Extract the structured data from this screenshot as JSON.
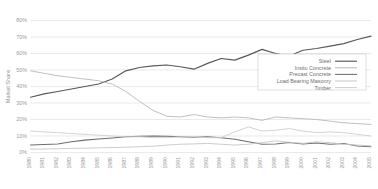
{
  "chart_data": {
    "type": "line",
    "title": "",
    "xlabel": "",
    "ylabel": "Market Share",
    "ylim": [
      0,
      80
    ],
    "ytick_labels": [
      "0%",
      "10%",
      "20%",
      "30%",
      "40%",
      "50%",
      "60%",
      "70%",
      "80%"
    ],
    "ytick_values": [
      0,
      10,
      20,
      30,
      40,
      50,
      60,
      70,
      80
    ],
    "grid": true,
    "legend_position": "center-right",
    "x": [
      1980,
      1981,
      1982,
      1983,
      1984,
      1985,
      1986,
      1987,
      1988,
      1989,
      1990,
      1991,
      1992,
      1993,
      1994,
      1995,
      1996,
      1997,
      1998,
      1999,
      2000,
      2001,
      2002,
      2003,
      2004,
      2005
    ],
    "xtick_labels": [
      "1980",
      "1981",
      "1982",
      "1983",
      "1984",
      "1985",
      "1986",
      "1987",
      "1988",
      "1989",
      "1990",
      "1991",
      "1992",
      "1993",
      "1994",
      "1995",
      "1996",
      "1997",
      "1998",
      "1999",
      "2000",
      "2001",
      "2002",
      "2003",
      "2004",
      "2005"
    ],
    "series": [
      {
        "name": "Steel",
        "color": "#585858",
        "width": 1.15,
        "values": [
          33.5,
          35.5,
          37.0,
          38.5,
          40.0,
          41.5,
          44.5,
          49.5,
          51.5,
          52.5,
          53.0,
          52.0,
          50.5,
          54.0,
          57.0,
          56.0,
          59.0,
          62.5,
          60.0,
          58.5,
          62.0,
          63.0,
          64.5,
          66.0,
          68.5,
          70.5
        ]
      },
      {
        "name": "Insitu Concrete",
        "color": "#b9b9b9",
        "width": 0.9,
        "values": [
          49.5,
          48.0,
          46.5,
          45.5,
          44.5,
          43.5,
          41.5,
          37.0,
          31.0,
          25.5,
          22.0,
          21.5,
          23.0,
          21.5,
          21.0,
          21.5,
          21.0,
          19.5,
          21.5,
          21.0,
          20.5,
          20.0,
          19.0,
          18.0,
          17.5,
          17.0
        ]
      },
      {
        "name": "Precast Concrete",
        "color": "#6e6e6e",
        "width": 1.05,
        "values": [
          4.5,
          4.8,
          5.2,
          6.5,
          7.5,
          8.2,
          8.8,
          9.5,
          9.8,
          10.0,
          9.8,
          9.5,
          9.2,
          9.5,
          9.0,
          8.0,
          6.5,
          5.0,
          5.2,
          6.0,
          5.2,
          5.8,
          5.0,
          5.5,
          4.0,
          3.5
        ]
      },
      {
        "name": "Load Bearing Masonry",
        "color": "#c6c6c6",
        "width": 0.9,
        "values": [
          2.0,
          2.1,
          2.3,
          2.5,
          2.6,
          2.8,
          3.0,
          3.2,
          3.5,
          3.8,
          4.5,
          5.0,
          5.2,
          5.5,
          5.0,
          4.5,
          5.0,
          6.0,
          7.0,
          6.2,
          5.5,
          6.5,
          6.0,
          5.0,
          4.5,
          4.0
        ]
      },
      {
        "name": "Timber",
        "color": "#cfcfcf",
        "width": 0.9,
        "values": [
          13.0,
          12.5,
          12.0,
          11.5,
          11.0,
          10.5,
          10.0,
          9.5,
          9.5,
          9.0,
          9.0,
          9.5,
          9.5,
          9.0,
          9.0,
          12.5,
          15.5,
          13.0,
          13.5,
          14.5,
          13.0,
          12.0,
          12.5,
          12.0,
          11.0,
          10.0
        ]
      }
    ]
  },
  "legend": {
    "entries": [
      {
        "label": "Steel"
      },
      {
        "label": "Insitu Concrete"
      },
      {
        "label": "Precast Concrete"
      },
      {
        "label": "Load Bearing Masonry"
      },
      {
        "label": "Timber"
      }
    ]
  }
}
